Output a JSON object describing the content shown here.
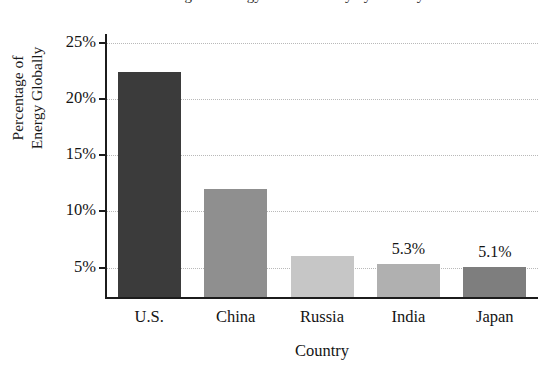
{
  "chart_data": {
    "type": "bar",
    "title": "Percentage of Energy Used Globally by Country",
    "xlabel": "Country",
    "ylabel": "Percentage of Energy Globally",
    "ylabel_lines": [
      "Percentage of",
      "Energy Globally"
    ],
    "categories": [
      "U.S.",
      "China",
      "Russia",
      "India",
      "Japan"
    ],
    "values": [
      22.4,
      12.0,
      6.0,
      5.3,
      5.1
    ],
    "value_labels": [
      "",
      "",
      "",
      "5.3%",
      "5.1%"
    ],
    "bar_colors": [
      "#3b3b3b",
      "#8f8f8f",
      "#c6c6c6",
      "#b0b0b0",
      "#7e7e7e"
    ],
    "ylim": [
      2.3,
      25.7
    ],
    "yticks": [
      5,
      10,
      15,
      20,
      25
    ],
    "ytick_labels": [
      "5%",
      "10%",
      "15%",
      "20%",
      "25%"
    ],
    "grid": "horizontal-dotted",
    "legend": "none",
    "axis_note": "y-axis truncated; baseline is not zero"
  },
  "axes": {
    "y_ticks": [
      {
        "label": "25%",
        "value": 25
      },
      {
        "label": "20%",
        "value": 20
      },
      {
        "label": "15%",
        "value": 15
      },
      {
        "label": "10%",
        "value": 10
      },
      {
        "label": "5%",
        "value": 5
      }
    ],
    "x_ticks": [
      {
        "label": "U.S."
      },
      {
        "label": "China"
      },
      {
        "label": "Russia"
      },
      {
        "label": "India"
      },
      {
        "label": "Japan"
      }
    ]
  },
  "colors": {
    "background": "#ffffff",
    "axis": "#1c1c1c",
    "gridline": "#b9b9b9",
    "text": "#141414"
  }
}
